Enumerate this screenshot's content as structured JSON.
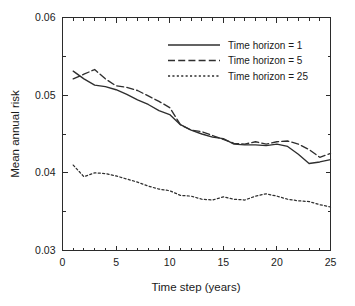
{
  "chart_data": {
    "type": "line",
    "title": "",
    "xlabel": "Time step (years)",
    "ylabel": "Mean annual risk",
    "xlim": [
      0,
      25
    ],
    "ylim": [
      0.03,
      0.06
    ],
    "grid": false,
    "legend_position": "top-right",
    "xticks": [
      0,
      5,
      10,
      15,
      20,
      25
    ],
    "xtick_labels": [
      "0",
      "5",
      "10",
      "15",
      "20",
      "25"
    ],
    "xminor_step": 1,
    "yticks": [
      0.03,
      0.04,
      0.05,
      0.06
    ],
    "ytick_labels": [
      "0.03",
      "0.04",
      "0.05",
      "0.06"
    ],
    "yminor_step": 0.005,
    "x": [
      1,
      2,
      3,
      4,
      5,
      6,
      7,
      8,
      9,
      10,
      11,
      12,
      13,
      14,
      15,
      16,
      17,
      18,
      19,
      20,
      21,
      22,
      23,
      24,
      25
    ],
    "series": [
      {
        "name": "Time horizon = 1",
        "style": "solid",
        "color": "#2f2f2f",
        "values": [
          0.0531,
          0.0521,
          0.0513,
          0.0511,
          0.0507,
          0.0501,
          0.0494,
          0.0488,
          0.048,
          0.0475,
          0.0462,
          0.0455,
          0.045,
          0.0446,
          0.0444,
          0.0437,
          0.0436,
          0.0436,
          0.0435,
          0.0437,
          0.0434,
          0.0424,
          0.0412,
          0.0414,
          0.0417
        ]
      },
      {
        "name": "Time horizon = 5",
        "style": "dashed",
        "color": "#2f2f2f",
        "values": [
          0.0521,
          0.0527,
          0.0533,
          0.0521,
          0.0512,
          0.051,
          0.0506,
          0.0499,
          0.0492,
          0.0484,
          0.0462,
          0.0455,
          0.0453,
          0.0448,
          0.0443,
          0.0438,
          0.0437,
          0.044,
          0.0437,
          0.044,
          0.0441,
          0.0437,
          0.043,
          0.042,
          0.0425
        ]
      },
      {
        "name": "Time horizon = 25",
        "style": "dotted",
        "color": "#2f2f2f",
        "values": [
          0.041,
          0.0395,
          0.04,
          0.0399,
          0.0396,
          0.0392,
          0.0388,
          0.0383,
          0.0379,
          0.0377,
          0.0371,
          0.037,
          0.0366,
          0.0365,
          0.0369,
          0.0366,
          0.0365,
          0.037,
          0.0373,
          0.037,
          0.0366,
          0.0364,
          0.0363,
          0.0359,
          0.0356
        ]
      }
    ]
  },
  "legend": {
    "items": [
      {
        "label": "Time horizon = 1"
      },
      {
        "label": "Time horizon = 5"
      },
      {
        "label": "Time horizon = 25"
      }
    ]
  }
}
